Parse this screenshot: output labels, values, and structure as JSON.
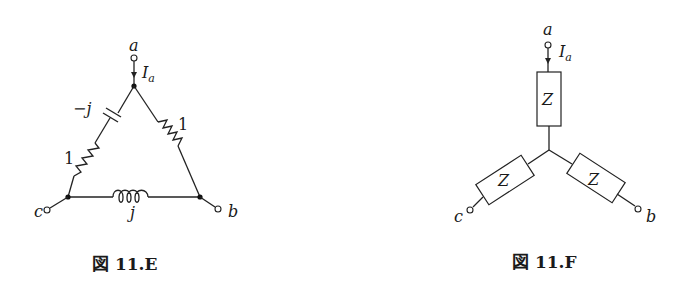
{
  "figures": [
    {
      "id": "11.E",
      "caption_prefix": "図",
      "caption_number": "11.E",
      "type": "delta-connected load",
      "terminals": {
        "a": "a",
        "b": "b",
        "c": "c"
      },
      "current_label_base": "I",
      "current_label_sub": "a",
      "branches": [
        {
          "between": "a-c",
          "elements": [
            {
              "kind": "capacitor",
              "label": "−j"
            },
            {
              "kind": "resistor",
              "label": "1"
            }
          ]
        },
        {
          "between": "a-b",
          "elements": [
            {
              "kind": "resistor",
              "label": "1"
            }
          ]
        },
        {
          "between": "c-b",
          "elements": [
            {
              "kind": "inductor",
              "label": "j"
            }
          ]
        }
      ]
    },
    {
      "id": "11.F",
      "caption_prefix": "図",
      "caption_number": "11.F",
      "type": "star (Y)-connected load",
      "terminals": {
        "a": "a",
        "b": "b",
        "c": "c"
      },
      "current_label_base": "I",
      "current_label_sub": "a",
      "impedances": [
        {
          "leg": "a",
          "label": "Z"
        },
        {
          "leg": "c",
          "label": "Z"
        },
        {
          "leg": "b",
          "label": "Z"
        }
      ]
    }
  ],
  "colors": {
    "ink": "#1a1a1a",
    "background": "#ffffff"
  }
}
